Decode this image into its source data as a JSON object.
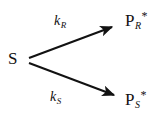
{
  "diagram": {
    "type": "reaction-scheme",
    "background_color": "#ffffff",
    "stroke_color": "#121212",
    "text_color": "#121212",
    "reactant": {
      "id": "S",
      "base": "S",
      "subscript": "",
      "superscript": ""
    },
    "products": [
      {
        "id": "PR",
        "base": "P",
        "subscript": "R",
        "superscript": "*",
        "position": "top-right"
      },
      {
        "id": "PS",
        "base": "P",
        "subscript": "S",
        "superscript": "*",
        "position": "bottom-right"
      }
    ],
    "arrows": [
      {
        "id": "arrow-upper",
        "from": "S",
        "to": "PR",
        "direction": "up-right",
        "rate_label": {
          "base": "k",
          "subscript": "R"
        }
      },
      {
        "id": "arrow-lower",
        "from": "S",
        "to": "PS",
        "direction": "down-right",
        "rate_label": {
          "base": "k",
          "subscript": "S"
        }
      }
    ]
  }
}
